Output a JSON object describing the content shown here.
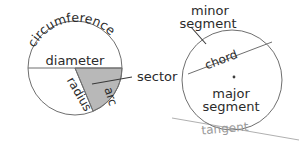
{
  "figure": {
    "background_color": "#ffffff",
    "stroke_color": "#6f6f6f",
    "sector_fill_color": "#b8b8b8",
    "tangent_color": "#b0b0b0",
    "text_color": "#2b2b2b"
  },
  "left_circle": {
    "name": "circle-parts-left",
    "center": {
      "x": 75,
      "y": 68
    },
    "radius": 47,
    "labels": {
      "circumference": "circumference",
      "diameter": "diameter",
      "radius": "radius",
      "arc": "arc",
      "sector": "sector"
    },
    "circumference_letters": [
      "c",
      "i",
      "r",
      "c",
      "u",
      "m",
      "f",
      "e",
      "r",
      "e",
      "n",
      "c",
      "e"
    ],
    "radius_letters": [
      "r",
      "a",
      "d",
      "i",
      "u",
      "s"
    ],
    "arc_letters": [
      "a",
      "r",
      "c"
    ],
    "sector_angles_deg": {
      "start": 0,
      "end": 67
    }
  },
  "right_circle": {
    "name": "circle-parts-right",
    "center": {
      "x": 232,
      "y": 80
    },
    "radius": 50,
    "labels": {
      "minor_segment_line1": "minor",
      "minor_segment_line2": "segment",
      "chord": "chord",
      "major_segment_line1": "major",
      "major_segment_line2": "segment",
      "tangent": "tangent"
    },
    "chord_letters": [
      "c",
      "h",
      "o",
      "r",
      "d"
    ],
    "tangent_letters": [
      "t",
      "a",
      "n",
      "g",
      "e",
      "n",
      "t"
    ],
    "chord_endpoints": {
      "start": {
        "x": 188,
        "y": 74
      },
      "end": {
        "x": 272,
        "y": 42
      }
    }
  }
}
